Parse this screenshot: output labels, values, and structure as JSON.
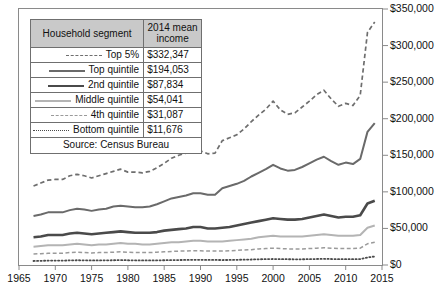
{
  "legend": {
    "headers": {
      "segment": "Household segment",
      "income": "2014 mean income"
    },
    "rows": [
      {
        "name": "Top 5%",
        "income": "$332,347",
        "style": "dashed",
        "key": "top5"
      },
      {
        "name": "Top quintile",
        "income": "$194,053",
        "style": "solid",
        "key": "topq"
      },
      {
        "name": "2nd quintile",
        "income": "$87,834",
        "style": "solid-thick",
        "key": "2ndq"
      },
      {
        "name": "Middle quintile",
        "income": "$54,041",
        "style": "solid-light",
        "key": "midq"
      },
      {
        "name": "4th quintile",
        "income": "$31,087",
        "style": "dashed-light",
        "key": "4thq"
      },
      {
        "name": "Bottom quintile",
        "income": "$11,676",
        "style": "dotted",
        "key": "botq"
      }
    ],
    "source": "Source: Census Bureau"
  },
  "chart_data": {
    "type": "line",
    "title": "",
    "xlabel": "",
    "ylabel": "",
    "xlim": [
      1965,
      2015
    ],
    "ylim": [
      0,
      350000
    ],
    "grid": false,
    "legend_position": "top-left-table",
    "y_ticks": [
      0,
      50000,
      100000,
      150000,
      200000,
      250000,
      300000,
      350000
    ],
    "y_tick_labels": [
      "$0",
      "$50,000",
      "$100,000",
      "$150,000",
      "$200,000",
      "$250,000",
      "$300,000",
      "$350,000"
    ],
    "x_ticks": [
      1965,
      1970,
      1975,
      1980,
      1985,
      1990,
      1995,
      2000,
      2005,
      2010,
      2015
    ],
    "x_tick_labels": [
      "1965",
      "1970",
      "1975",
      "1980",
      "1985",
      "1990",
      "1995",
      "2000",
      "2005",
      "2010",
      "2015"
    ],
    "x": [
      1967,
      1968,
      1969,
      1970,
      1971,
      1972,
      1973,
      1974,
      1975,
      1976,
      1977,
      1978,
      1979,
      1980,
      1981,
      1982,
      1983,
      1984,
      1985,
      1986,
      1987,
      1988,
      1989,
      1990,
      1991,
      1992,
      1993,
      1994,
      1995,
      1996,
      1997,
      1998,
      1999,
      2000,
      2001,
      2002,
      2003,
      2004,
      2005,
      2006,
      2007,
      2008,
      2009,
      2010,
      2011,
      2012,
      2013,
      2014
    ],
    "series": [
      {
        "name": "Top 5%",
        "color": "#6e6e6e",
        "style": "dashed",
        "width": 1.7,
        "final_value": 332347,
        "values": [
          108000,
          112000,
          116000,
          117000,
          117000,
          122000,
          124000,
          122000,
          119000,
          122000,
          125000,
          128000,
          131000,
          127000,
          127000,
          126000,
          128000,
          133000,
          139000,
          146000,
          150000,
          153000,
          158000,
          156000,
          152000,
          153000,
          170000,
          174000,
          178000,
          186000,
          196000,
          205000,
          213000,
          224000,
          212000,
          206000,
          208000,
          216000,
          224000,
          233000,
          239000,
          227000,
          217000,
          221000,
          218000,
          232000,
          318000,
          332347
        ]
      },
      {
        "name": "Top quintile",
        "color": "#6a6a6a",
        "style": "solid",
        "width": 2.0,
        "final_value": 194053,
        "values": [
          67000,
          69000,
          72000,
          72000,
          72000,
          75000,
          77000,
          76000,
          74000,
          76000,
          77000,
          80000,
          81000,
          80000,
          79000,
          79000,
          80000,
          83000,
          87000,
          91000,
          93000,
          95000,
          98000,
          98000,
          96000,
          96000,
          105000,
          108000,
          111000,
          115000,
          121000,
          126000,
          131000,
          137000,
          132000,
          129000,
          130000,
          134000,
          139000,
          144000,
          148000,
          142000,
          137000,
          140000,
          138000,
          145000,
          182000,
          194053
        ]
      },
      {
        "name": "2nd quintile",
        "color": "#4a4a4a",
        "style": "solid",
        "width": 2.6,
        "final_value": 87834,
        "values": [
          38000,
          39000,
          41000,
          41000,
          41000,
          43000,
          44000,
          43000,
          42000,
          43000,
          44000,
          45000,
          46000,
          45000,
          44000,
          44000,
          44000,
          45000,
          47000,
          48000,
          49000,
          50000,
          52000,
          52000,
          50000,
          50000,
          51000,
          52000,
          54000,
          56000,
          58000,
          60000,
          62000,
          64000,
          63000,
          62000,
          62000,
          63000,
          65000,
          67000,
          69000,
          67000,
          65000,
          66000,
          66000,
          68000,
          84000,
          87834
        ]
      },
      {
        "name": "Middle quintile",
        "color": "#b4b4b4",
        "style": "solid",
        "width": 2.0,
        "final_value": 54041,
        "values": [
          25000,
          26000,
          27000,
          27000,
          27000,
          28000,
          29000,
          28000,
          27000,
          28000,
          28000,
          29000,
          30000,
          29000,
          29000,
          28000,
          28000,
          29000,
          30000,
          31000,
          31000,
          32000,
          33000,
          33000,
          32000,
          32000,
          32000,
          33000,
          34000,
          35000,
          36000,
          38000,
          39000,
          40000,
          39000,
          39000,
          39000,
          39000,
          40000,
          41000,
          42000,
          41000,
          40000,
          40000,
          40000,
          41000,
          51000,
          54041
        ]
      },
      {
        "name": "4th quintile",
        "color": "#9a9a9a",
        "style": "dashed",
        "width": 1.5,
        "final_value": 31087,
        "values": [
          15000,
          15500,
          16000,
          16000,
          16000,
          17000,
          17500,
          17000,
          16500,
          17000,
          17000,
          17500,
          18000,
          17500,
          17000,
          17000,
          17000,
          17500,
          18000,
          18500,
          19000,
          19000,
          19500,
          19500,
          19000,
          19000,
          19000,
          19500,
          20000,
          20500,
          21000,
          22000,
          22500,
          23000,
          22500,
          22000,
          22000,
          22000,
          22500,
          23000,
          23500,
          23000,
          22500,
          22500,
          22500,
          23000,
          29000,
          31087
        ]
      },
      {
        "name": "Bottom quintile",
        "color": "#4a4a4a",
        "style": "dotted",
        "width": 1.8,
        "final_value": 11676,
        "values": [
          5500,
          5700,
          6000,
          6000,
          6000,
          6300,
          6500,
          6400,
          6200,
          6300,
          6400,
          6500,
          6700,
          6500,
          6300,
          6200,
          6200,
          6300,
          6500,
          6700,
          6800,
          6900,
          7100,
          7100,
          6900,
          6900,
          6800,
          6900,
          7100,
          7300,
          7500,
          7800,
          8000,
          8200,
          8000,
          7900,
          7800,
          7800,
          8000,
          8200,
          8400,
          8200,
          7900,
          7900,
          7900,
          8100,
          10300,
          11676
        ]
      }
    ]
  }
}
